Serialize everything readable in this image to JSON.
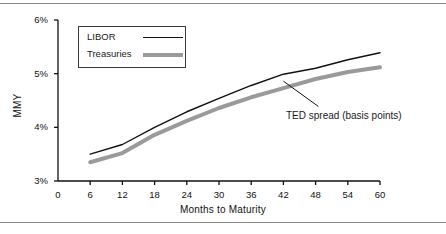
{
  "figure": {
    "y_axis_title": "MMY",
    "x_axis_title": "Months to Maturity",
    "annotation": "TED spread (basis points)",
    "legend": {
      "items": [
        {
          "label": "LIBOR",
          "style": "thin-black-line",
          "color": "#111111"
        },
        {
          "label": "Treasuries",
          "style": "thick-gray-line",
          "color": "#9a9a9a"
        }
      ]
    },
    "y_ticks": [
      "3%",
      "4%",
      "5%",
      "6%"
    ],
    "x_ticks": [
      "0",
      "6",
      "12",
      "18",
      "24",
      "30",
      "36",
      "42",
      "48",
      "54",
      "60"
    ]
  },
  "chart_data": {
    "type": "line",
    "title": "",
    "subtitle": "",
    "xlabel": "Months to Maturity",
    "ylabel": "MMY",
    "xlim": [
      0,
      60
    ],
    "ylim": [
      3,
      6
    ],
    "x": [
      6,
      12,
      18,
      24,
      30,
      36,
      42,
      48,
      54,
      60
    ],
    "xtick_labels": [
      "0",
      "6",
      "12",
      "18",
      "24",
      "30",
      "36",
      "42",
      "48",
      "54",
      "60"
    ],
    "ytick_labels": [
      "3%",
      "4%",
      "5%",
      "6%"
    ],
    "ytick_values": [
      3,
      4,
      5,
      6
    ],
    "grid": false,
    "legend_position": "top-left-inside",
    "series": [
      {
        "name": "LIBOR",
        "color": "#111111",
        "line_width": 1.4,
        "values": [
          3.5,
          3.68,
          4.0,
          4.29,
          4.54,
          4.78,
          4.99,
          5.1,
          5.26,
          5.39
        ]
      },
      {
        "name": "Treasuries",
        "color": "#9a9a9a",
        "line_width": 4,
        "values": [
          3.35,
          3.52,
          3.86,
          4.12,
          4.36,
          4.56,
          4.73,
          4.9,
          5.03,
          5.12
        ]
      }
    ],
    "annotations": [
      {
        "text": "TED spread (basis points)",
        "leader_from": [
          42,
          4.86
        ],
        "leader_to": [
          48.5,
          4.39
        ]
      }
    ]
  },
  "geometry": {
    "plot_left": 58,
    "plot_right": 380,
    "plot_top": 12,
    "plot_bottom": 173
  }
}
